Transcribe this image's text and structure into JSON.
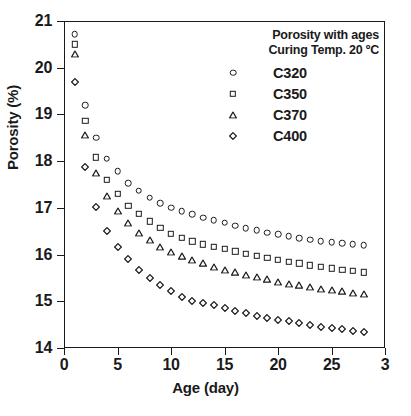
{
  "chart_data": {
    "type": "scatter",
    "title": "",
    "xlabel": "Age (day)",
    "ylabel": "Porosity (%)",
    "xlim": [
      0,
      30
    ],
    "ylim": [
      14,
      21
    ],
    "xticks": [
      "0",
      "5",
      "10",
      "15",
      "20",
      "25",
      "3"
    ],
    "xtick_values": [
      0,
      5,
      10,
      15,
      20,
      25,
      30
    ],
    "yticks": [
      "14",
      "15",
      "16",
      "17",
      "18",
      "19",
      "20",
      "21"
    ],
    "ytick_values": [
      14,
      15,
      16,
      17,
      18,
      19,
      20,
      21
    ],
    "grid": false,
    "legend_position": "top-right",
    "legend_title_lines": [
      "Porosity with ages",
      "Curing Temp. 20 ºC"
    ],
    "x": [
      1,
      2,
      3,
      4,
      5,
      6,
      7,
      8,
      9,
      10,
      11,
      12,
      13,
      14,
      15,
      16,
      17,
      18,
      19,
      20,
      21,
      22,
      23,
      24,
      25,
      26,
      27,
      28
    ],
    "series": [
      {
        "name": "C320",
        "marker": "circle",
        "values": [
          20.72,
          19.2,
          18.5,
          18.05,
          17.78,
          17.53,
          17.37,
          17.22,
          17.1,
          17.0,
          16.93,
          16.86,
          16.79,
          16.73,
          16.68,
          16.62,
          16.57,
          16.52,
          16.47,
          16.43,
          16.39,
          16.35,
          16.32,
          16.29,
          16.26,
          16.24,
          16.22,
          16.2
        ]
      },
      {
        "name": "C350",
        "marker": "square",
        "values": [
          20.5,
          18.87,
          18.08,
          17.6,
          17.3,
          17.05,
          16.87,
          16.71,
          16.57,
          16.45,
          16.36,
          16.28,
          16.22,
          16.17,
          16.12,
          16.07,
          16.02,
          15.98,
          15.93,
          15.89,
          15.85,
          15.81,
          15.77,
          15.74,
          15.71,
          15.68,
          15.65,
          15.62
        ]
      },
      {
        "name": "C370",
        "marker": "triangle",
        "values": [
          20.3,
          18.57,
          17.75,
          17.25,
          16.93,
          16.67,
          16.47,
          16.31,
          16.17,
          16.05,
          15.96,
          15.88,
          15.81,
          15.74,
          15.68,
          15.62,
          15.57,
          15.52,
          15.47,
          15.42,
          15.38,
          15.34,
          15.3,
          15.27,
          15.24,
          15.21,
          15.18,
          15.15
        ]
      },
      {
        "name": "C400",
        "marker": "diamond",
        "values": [
          19.7,
          17.88,
          17.02,
          16.5,
          16.17,
          15.9,
          15.68,
          15.5,
          15.35,
          15.22,
          15.1,
          15.0,
          14.97,
          14.91,
          14.85,
          14.8,
          14.74,
          14.69,
          14.65,
          14.61,
          14.57,
          14.53,
          14.5,
          14.46,
          14.43,
          14.4,
          14.37,
          14.35
        ]
      }
    ]
  },
  "colors": {
    "ink": "#1a1a1a",
    "background": "#ffffff"
  }
}
